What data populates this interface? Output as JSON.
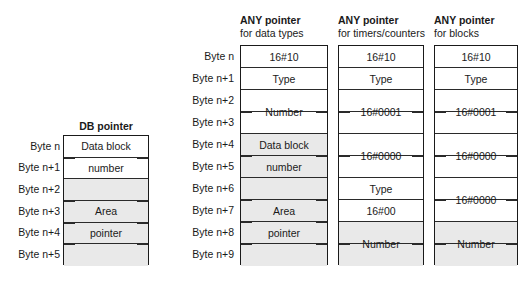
{
  "diagram": {
    "byte_label_prefix": "Byte",
    "colors": {
      "background": "#ffffff",
      "border": "#1a1a1a",
      "row_divider": "#2a2a2a",
      "shaded_fill": "#e9e9e9",
      "text": "#1a1a1a"
    }
  },
  "db_pointer": {
    "heading": "DB pointer",
    "byte_labels": [
      "Byte n",
      "Byte n+1",
      "Byte n+2",
      "Byte n+3",
      "Byte n+4",
      "Byte n+5"
    ],
    "rows": [
      {
        "index": 0,
        "shaded": false
      },
      {
        "index": 1,
        "shaded": false
      },
      {
        "index": 2,
        "shaded": true
      },
      {
        "index": 3,
        "shaded": true
      },
      {
        "index": 4,
        "shaded": true
      },
      {
        "index": 5,
        "shaded": true
      }
    ],
    "fields": [
      {
        "label": "Data block",
        "start_row": 0,
        "span": 1,
        "ticks": false
      },
      {
        "label": "number",
        "start_row": 1,
        "span": 1,
        "ticks": false
      },
      {
        "label": "Area",
        "start_row": 3,
        "span": 1,
        "ticks": false
      },
      {
        "label": "pointer",
        "start_row": 4,
        "span": 1,
        "ticks": false
      }
    ],
    "span_ticks": [
      1,
      3,
      4,
      5
    ]
  },
  "any_data_types": {
    "heading_strong": "ANY pointer",
    "heading_sub": "for data types",
    "byte_labels": [
      "Byte n",
      "Byte n+1",
      "Byte n+2",
      "Byte n+3",
      "Byte n+4",
      "Byte n+5",
      "Byte n+6",
      "Byte n+7",
      "Byte n+8",
      "Byte n+9"
    ],
    "rows": [
      {
        "index": 0,
        "shaded": false
      },
      {
        "index": 1,
        "shaded": false
      },
      {
        "index": 2,
        "shaded": false
      },
      {
        "index": 3,
        "shaded": false
      },
      {
        "index": 4,
        "shaded": true
      },
      {
        "index": 5,
        "shaded": true
      },
      {
        "index": 6,
        "shaded": true
      },
      {
        "index": 7,
        "shaded": true
      },
      {
        "index": 8,
        "shaded": true
      },
      {
        "index": 9,
        "shaded": true
      }
    ],
    "fields": [
      {
        "label": "16#10",
        "start_row": 0,
        "span": 1,
        "ticks": false
      },
      {
        "label": "Type",
        "start_row": 1,
        "span": 1,
        "ticks": false
      },
      {
        "label": "Number",
        "start_row": 2,
        "span": 2,
        "ticks": true
      },
      {
        "label": "Data block",
        "start_row": 4,
        "span": 1,
        "ticks": false
      },
      {
        "label": "number",
        "start_row": 5,
        "span": 1,
        "ticks": false
      },
      {
        "label": "Area",
        "start_row": 7,
        "span": 1,
        "ticks": false
      },
      {
        "label": "pointer",
        "start_row": 8,
        "span": 1,
        "ticks": false
      }
    ],
    "span_ticks": [
      5,
      7,
      8,
      9
    ]
  },
  "any_timers_counters": {
    "heading_strong": "ANY pointer",
    "heading_sub": "for timers/counters",
    "rows": [
      {
        "index": 0,
        "shaded": false
      },
      {
        "index": 1,
        "shaded": false
      },
      {
        "index": 2,
        "shaded": false
      },
      {
        "index": 3,
        "shaded": false
      },
      {
        "index": 4,
        "shaded": false
      },
      {
        "index": 5,
        "shaded": false
      },
      {
        "index": 6,
        "shaded": false
      },
      {
        "index": 7,
        "shaded": false
      },
      {
        "index": 8,
        "shaded": true
      },
      {
        "index": 9,
        "shaded": true
      }
    ],
    "fields": [
      {
        "label": "16#10",
        "start_row": 0,
        "span": 1,
        "ticks": false
      },
      {
        "label": "Type",
        "start_row": 1,
        "span": 1,
        "ticks": false
      },
      {
        "label": "16#0001",
        "start_row": 2,
        "span": 2,
        "ticks": true
      },
      {
        "label": "16#0000",
        "start_row": 4,
        "span": 2,
        "ticks": true
      },
      {
        "label": "Type",
        "start_row": 6,
        "span": 1,
        "ticks": false
      },
      {
        "label": "16#00",
        "start_row": 7,
        "span": 1,
        "ticks": false
      },
      {
        "label": "Number",
        "start_row": 8,
        "span": 2,
        "ticks": true
      }
    ],
    "span_ticks": []
  },
  "any_blocks": {
    "heading_strong": "ANY pointer",
    "heading_sub": "for blocks",
    "rows": [
      {
        "index": 0,
        "shaded": false
      },
      {
        "index": 1,
        "shaded": false
      },
      {
        "index": 2,
        "shaded": false
      },
      {
        "index": 3,
        "shaded": false
      },
      {
        "index": 4,
        "shaded": false
      },
      {
        "index": 5,
        "shaded": false
      },
      {
        "index": 6,
        "shaded": false
      },
      {
        "index": 7,
        "shaded": false
      },
      {
        "index": 8,
        "shaded": true
      },
      {
        "index": 9,
        "shaded": true
      }
    ],
    "fields": [
      {
        "label": "16#10",
        "start_row": 0,
        "span": 1,
        "ticks": false
      },
      {
        "label": "Type",
        "start_row": 1,
        "span": 1,
        "ticks": false
      },
      {
        "label": "16#0001",
        "start_row": 2,
        "span": 2,
        "ticks": true
      },
      {
        "label": "16#0000",
        "start_row": 4,
        "span": 2,
        "ticks": true
      },
      {
        "label": "16#0000",
        "start_row": 6,
        "span": 2,
        "ticks": true
      },
      {
        "label": "Number",
        "start_row": 8,
        "span": 2,
        "ticks": true
      }
    ],
    "span_ticks": []
  }
}
